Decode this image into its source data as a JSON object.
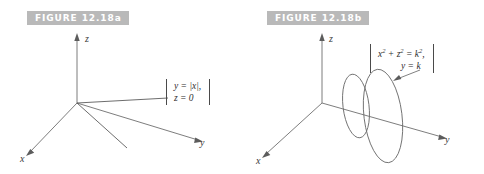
{
  "figure_a": {
    "label": "FIGURE 12.18a",
    "axes": [
      {
        "name": "z-axis",
        "label": "z"
      },
      {
        "name": "x-axis",
        "label": "x"
      },
      {
        "name": "y-axis",
        "label": "y"
      }
    ],
    "equation_lines": [
      "y = |x|,",
      "z = 0"
    ],
    "graphic": "two rays from origin forming the V-shaped trace of y = |x| in the plane z = 0"
  },
  "figure_b": {
    "label": "FIGURE 12.18b",
    "axes": [
      {
        "name": "z-axis",
        "label": "z"
      },
      {
        "name": "x-axis",
        "label": "x"
      },
      {
        "name": "y-axis",
        "label": "y"
      }
    ],
    "equation_line_1_pre": "x",
    "equation_line_1_sup1": "2",
    "equation_line_1_mid": " + z",
    "equation_line_1_sup2": "2",
    "equation_line_1_post": " = k",
    "equation_line_1_sup3": "2",
    "equation_line_1_tail": ",",
    "equation_line_2": "y = k",
    "graphic": "two circular cross-sections (drawn as ellipses) in planes y = k"
  },
  "colors": {
    "label_background": "#b9b9b9",
    "label_text": "#ffffff",
    "axis_stroke": "#6e6e6e",
    "curve_stroke": "#6b6b6b",
    "text": "#2e2e2e",
    "page_background": "#ffffff"
  }
}
